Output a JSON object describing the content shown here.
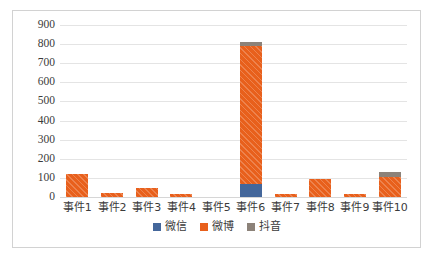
{
  "chart_data": {
    "type": "bar",
    "subtype": "stacked-column",
    "title": "",
    "xlabel": "",
    "ylabel": "",
    "ylim": [
      0,
      900
    ],
    "ytick_step": 100,
    "ytick_labels": [
      "900",
      "800",
      "700",
      "600",
      "500",
      "400",
      "300",
      "200",
      "100",
      "0"
    ],
    "grid": true,
    "legend_position": "bottom",
    "categories": [
      "事件1",
      "事件2",
      "事件3",
      "事件4",
      "事件5",
      "事件6",
      "事件7",
      "事件8",
      "事件9",
      "事件10"
    ],
    "series": [
      {
        "name": "微信",
        "color": "#44679b",
        "values": [
          0,
          0,
          0,
          0,
          0,
          70,
          0,
          0,
          0,
          0
        ]
      },
      {
        "name": "微博",
        "color": "#e8601c",
        "values": [
          120,
          22,
          48,
          18,
          0,
          720,
          15,
          93,
          16,
          105
        ]
      },
      {
        "name": "抖音",
        "color": "#8c8279",
        "values": [
          0,
          0,
          0,
          0,
          0,
          20,
          0,
          0,
          0,
          27
        ]
      }
    ],
    "totals": [
      120,
      22,
      48,
      18,
      0,
      810,
      15,
      93,
      16,
      132
    ]
  },
  "legend": {
    "items": [
      {
        "label": "微信",
        "color": "#44679b",
        "swatch": "legend-swatch-wechat"
      },
      {
        "label": "微博",
        "color": "#e8601c",
        "swatch": "legend-swatch-weibo"
      },
      {
        "label": "抖音",
        "color": "#8c8279",
        "swatch": "legend-swatch-douyin"
      }
    ]
  }
}
